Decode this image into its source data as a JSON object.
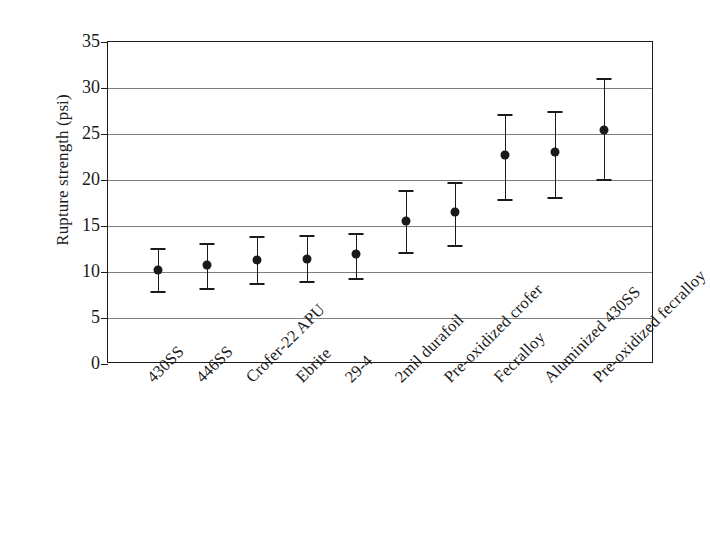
{
  "chart_data": {
    "type": "scatter",
    "title": "",
    "xlabel": "",
    "ylabel": "Rupture strength (psi)",
    "ylim": [
      0,
      35
    ],
    "yticks": [
      0,
      5,
      10,
      15,
      20,
      25,
      30,
      35
    ],
    "ytick_labels": [
      "0",
      "5",
      "10",
      "15",
      "20",
      "25",
      "30",
      "35"
    ],
    "grid": true,
    "grid_axis": "y",
    "legend": "none",
    "marker": "filled-circle",
    "error_bars": "vertical-with-caps",
    "categories": [
      "430SS",
      "446SS",
      "Crofer-22 APU",
      "Ebrite",
      "29-4",
      "2mil durafoil",
      "Pre-oxidized crofer",
      "Fecralloy",
      "Aluminized 430SS",
      "Pre-oxidized fecralloy"
    ],
    "values": [
      10.2,
      10.8,
      11.3,
      11.4,
      12.0,
      15.5,
      16.5,
      22.7,
      23.0,
      25.4
    ],
    "err_low": [
      7.9,
      8.3,
      8.8,
      9.0,
      9.3,
      12.2,
      12.9,
      17.9,
      18.1,
      20.1
    ],
    "err_high": [
      12.6,
      13.2,
      13.9,
      14.0,
      14.2,
      18.9,
      19.8,
      27.2,
      27.5,
      31.1
    ]
  },
  "axes": {
    "ylabel": "Rupture strength (psi)"
  }
}
